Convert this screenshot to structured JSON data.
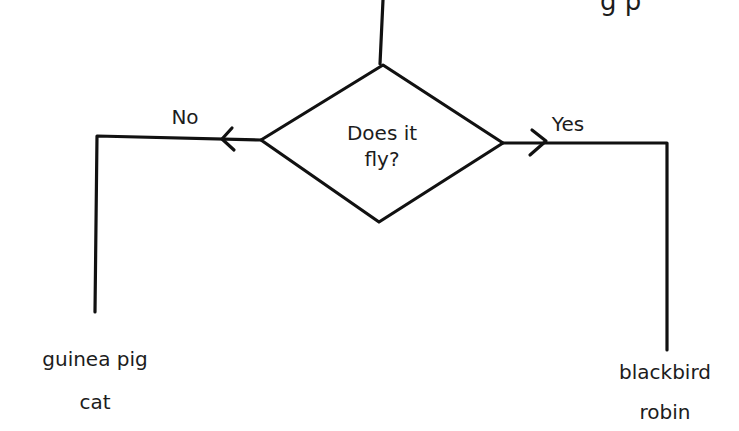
{
  "diagram": {
    "type": "flowchart",
    "clipped_top_text": "g p",
    "decision": {
      "line1": "Does it",
      "line2": "fly?"
    },
    "branches": {
      "no": {
        "label": "No",
        "items": [
          "guinea pig",
          "cat"
        ]
      },
      "yes": {
        "label": "Yes",
        "items": [
          "blackbird",
          "robin"
        ]
      }
    },
    "stroke_color": "#111111"
  }
}
